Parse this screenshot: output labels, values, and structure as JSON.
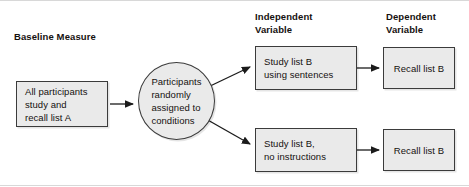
{
  "figure": {
    "background_color": "#ffffff",
    "node_fill_color": "#eaeaea",
    "node_border_color": "#3b3b3b",
    "text_color": "#15110f"
  },
  "labels": {
    "baseline": "Baseline Measure",
    "independent_variable": "Independent\nVariable",
    "dependent_variable": "Dependent\nVariable"
  },
  "nodes": {
    "baseline_box": "All participants\nstudy and\nrecall list A",
    "random_assignment": "Participants\nrandomly\nassigned to\nconditions",
    "condition_1_iv": "Study list B\nusing sentences",
    "condition_1_dv": "Recall list B",
    "condition_2_iv": "Study list B,\nno instructions",
    "condition_2_dv": "Recall list B"
  },
  "connections": [
    {
      "name": "baseline-to-assignment",
      "from": "baseline_box",
      "to": "random_assignment",
      "style": "straight-arrow"
    },
    {
      "name": "assignment-to-condition-1",
      "from": "random_assignment",
      "to": "condition_1_iv",
      "style": "diagonal-arrow-up"
    },
    {
      "name": "assignment-to-condition-2",
      "from": "random_assignment",
      "to": "condition_2_iv",
      "style": "diagonal-arrow-down"
    },
    {
      "name": "condition-1-iv-to-dv",
      "from": "condition_1_iv",
      "to": "condition_1_dv",
      "style": "straight-arrow"
    },
    {
      "name": "condition-2-iv-to-dv",
      "from": "condition_2_iv",
      "to": "condition_2_dv",
      "style": "straight-arrow"
    }
  ]
}
